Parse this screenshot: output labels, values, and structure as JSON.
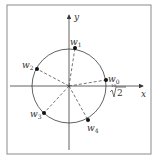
{
  "diagram": {
    "type": "complex-plane-roots",
    "axes": {
      "x_label": "x",
      "y_label": "y"
    },
    "radius_label": {
      "index": "10",
      "radicand": "2",
      "text": "10√2"
    },
    "points": [
      {
        "name": "w",
        "sub": "0",
        "label": "w0"
      },
      {
        "name": "w",
        "sub": "1",
        "label": "w1"
      },
      {
        "name": "w",
        "sub": "2",
        "label": "w2"
      },
      {
        "name": "w",
        "sub": "3",
        "label": "w3"
      },
      {
        "name": "w",
        "sub": "4",
        "label": "w4"
      }
    ],
    "colors": {
      "line": "#3a3a3a",
      "frame": "#8a8a8a",
      "point": "#111111",
      "background": "#ffffff"
    }
  }
}
